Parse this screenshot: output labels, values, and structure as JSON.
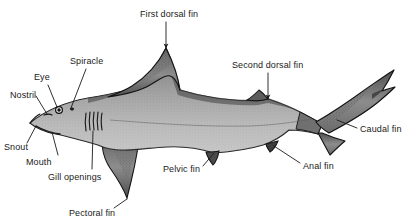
{
  "figure": {
    "background_color": "#ffffff",
    "text_color": "#1a1a1a",
    "outline_color": "#111111",
    "body_fill_dorsal": "#8a8a8a",
    "body_fill_ventral": "#c9c9c9",
    "fin_fill_dark": "#6f6f6f"
  },
  "labels": [
    {
      "id": "first-dorsal-fin",
      "text": "First dorsal fin",
      "x": 140,
      "y": 9,
      "leader": {
        "x1": 166,
        "y1": 22,
        "x2": 166,
        "y2": 48,
        "arrow": true
      }
    },
    {
      "id": "second-dorsal-fin",
      "text": "Second dorsal fin",
      "x": 232,
      "y": 60,
      "leader": {
        "x1": 268,
        "y1": 73,
        "x2": 268,
        "y2": 99,
        "arrow": true
      }
    },
    {
      "id": "spiracle",
      "text": "Spiracle",
      "x": 70,
      "y": 56,
      "leader": {
        "x1": 86,
        "y1": 69,
        "x2": 71,
        "y2": 108,
        "arrow": false
      }
    },
    {
      "id": "eye",
      "text": "Eye",
      "x": 34,
      "y": 72,
      "leader": {
        "x1": 48,
        "y1": 85,
        "x2": 57,
        "y2": 107,
        "arrow": false
      }
    },
    {
      "id": "nostril",
      "text": "Nostril",
      "x": 10,
      "y": 90,
      "leader": {
        "x1": 36,
        "y1": 96,
        "x2": 47,
        "y2": 114,
        "arrow": false
      }
    },
    {
      "id": "snout",
      "text": "Snout",
      "x": 4,
      "y": 142,
      "leader": {
        "x1": 27,
        "y1": 143,
        "x2": 36,
        "y2": 126,
        "arrow": false
      }
    },
    {
      "id": "mouth",
      "text": "Mouth",
      "x": 26,
      "y": 157,
      "leader": {
        "x1": 58,
        "y1": 155,
        "x2": 52,
        "y2": 132,
        "arrow": false
      }
    },
    {
      "id": "gill-openings",
      "text": "Gill openings",
      "x": 48,
      "y": 172,
      "leader": {
        "x1": 92,
        "y1": 169,
        "x2": 93,
        "y2": 131,
        "arrow": false
      }
    },
    {
      "id": "pectoral-fin",
      "text": "Pectoral fin",
      "x": 69,
      "y": 208,
      "leader": {
        "x1": 114,
        "y1": 208,
        "x2": 127,
        "y2": 199,
        "arrow": false
      }
    },
    {
      "id": "pelvic-fin",
      "text": "Pelvic fin",
      "x": 163,
      "y": 164,
      "leader": {
        "x1": 203,
        "y1": 166,
        "x2": 214,
        "y2": 153,
        "arrow": false
      }
    },
    {
      "id": "anal-fin",
      "text": "Anal fin",
      "x": 303,
      "y": 161,
      "leader": {
        "x1": 300,
        "y1": 163,
        "x2": 274,
        "y2": 146,
        "arrow": false
      }
    },
    {
      "id": "caudal-fin",
      "text": "Caudal fin",
      "x": 360,
      "y": 124,
      "leader": {
        "x1": 357,
        "y1": 128,
        "x2": 337,
        "y2": 120,
        "arrow": false
      }
    }
  ],
  "anatomy_parts": [
    "first dorsal fin",
    "second dorsal fin",
    "spiracle",
    "eye",
    "nostril",
    "snout",
    "mouth",
    "gill openings",
    "pectoral fin",
    "pelvic fin",
    "anal fin",
    "caudal fin"
  ]
}
